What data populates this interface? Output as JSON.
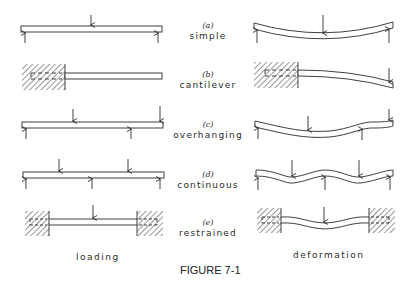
{
  "figure": {
    "caption": "FIGURE 7-1",
    "columns": {
      "left": "loading",
      "right": "deformation"
    },
    "cases": [
      {
        "id": "a",
        "case_label": "(a)",
        "name": "simple"
      },
      {
        "id": "b",
        "case_label": "(b)",
        "name": "cantilever"
      },
      {
        "id": "c",
        "case_label": "(c)",
        "name": "overhanging"
      },
      {
        "id": "d",
        "case_label": "(d)",
        "name": "continuous"
      },
      {
        "id": "e",
        "case_label": "(e)",
        "name": "restrained"
      }
    ],
    "colors": {
      "line": "#2a2a2a",
      "background": "#ffffff"
    }
  }
}
